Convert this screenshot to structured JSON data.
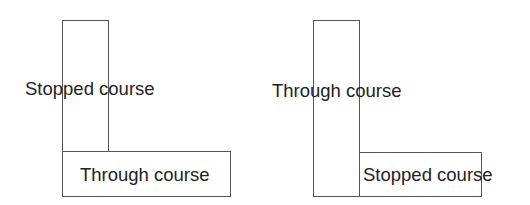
{
  "diagrams": [
    {
      "name": "stopped-course-over-through-course",
      "vertical_label": "Stopped course",
      "horizontal_label": "Through course"
    },
    {
      "name": "through-course-over-stopped-course",
      "vertical_label": "Through course",
      "horizontal_label": "Stopped course"
    }
  ]
}
